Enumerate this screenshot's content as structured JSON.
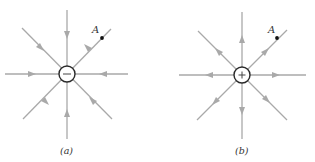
{
  "diagrams": [
    {
      "id": "a",
      "caption": "(a)",
      "charge_sign": "−",
      "charge_type": "negative",
      "field_direction": "inward",
      "point_label": "A",
      "center": [
        67,
        74
      ]
    },
    {
      "id": "b",
      "caption": "(b)",
      "charge_sign": "+",
      "charge_type": "positive",
      "field_direction": "outward",
      "point_label": "A",
      "center": [
        242,
        75
      ]
    }
  ],
  "colors": {
    "field_line": "#a9a9a9",
    "charge_outline": "#2a2a2a",
    "point": "#111111",
    "text": "#333333"
  }
}
